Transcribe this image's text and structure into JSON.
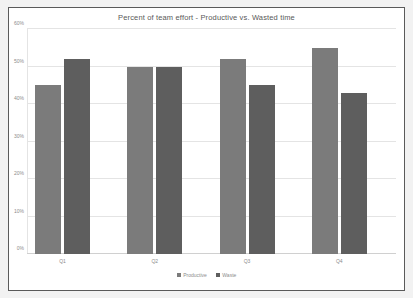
{
  "chart_data": {
    "type": "bar",
    "title": "Percent of team effort  - Productive vs. Wasted time",
    "xlabel": "",
    "ylabel": "",
    "categories": [
      "Q1",
      "Q2",
      "Q3",
      "Q4"
    ],
    "series": [
      {
        "name": "Productive",
        "values": [
          45,
          50,
          52,
          55
        ],
        "color": "#7b7b7b"
      },
      {
        "name": "Waste",
        "values": [
          52,
          50,
          45,
          43
        ],
        "color": "#5e5e5e"
      }
    ],
    "ylim": [
      0,
      60
    ],
    "ytick_values": [
      0,
      10,
      20,
      30,
      40,
      50,
      60
    ],
    "ytick_labels": [
      "0%",
      "10%",
      "20%",
      "30%",
      "40%",
      "50%",
      "60%"
    ],
    "grid": true,
    "legend_position": "bottom"
  }
}
